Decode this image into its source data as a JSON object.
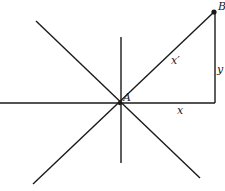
{
  "diagram": {
    "points": {
      "origin": {
        "label": "A"
      },
      "endpoint": {
        "label": "B"
      }
    },
    "labels": {
      "rotated_axis": "x′",
      "horizontal_leg": "x",
      "vertical_leg": "y"
    }
  }
}
